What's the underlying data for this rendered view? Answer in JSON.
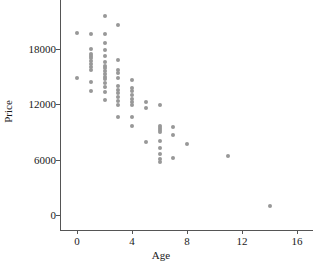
{
  "chart_data": {
    "type": "scatter",
    "title": "",
    "xlabel": "Age",
    "ylabel": "Price",
    "xlim": [
      -1.4,
      18.4
    ],
    "ylim": [
      -1600,
      21800
    ],
    "grid": false,
    "legend": null,
    "marker": {
      "shape": "circle",
      "color": "#989898",
      "size_px": 4
    },
    "xticks": [
      0,
      4,
      8,
      12,
      16
    ],
    "xtick_labels": [
      "0",
      "4",
      "8",
      "12",
      "16"
    ],
    "yticks": [
      0,
      6000,
      12000,
      18000
    ],
    "ytick_labels": [
      "0",
      "6000",
      "12000",
      "18000"
    ],
    "points": [
      {
        "x": 0,
        "y": 19700
      },
      {
        "x": 0,
        "y": 14850
      },
      {
        "x": 1,
        "y": 19600
      },
      {
        "x": 1,
        "y": 17950
      },
      {
        "x": 1,
        "y": 17500
      },
      {
        "x": 1,
        "y": 17250
      },
      {
        "x": 1,
        "y": 17000
      },
      {
        "x": 1,
        "y": 16750
      },
      {
        "x": 1,
        "y": 16400
      },
      {
        "x": 1,
        "y": 16100
      },
      {
        "x": 1,
        "y": 15750
      },
      {
        "x": 1,
        "y": 14400
      },
      {
        "x": 1,
        "y": 13500
      },
      {
        "x": 2,
        "y": 21550
      },
      {
        "x": 2,
        "y": 19600
      },
      {
        "x": 2,
        "y": 18650
      },
      {
        "x": 2,
        "y": 17900
      },
      {
        "x": 2,
        "y": 17200
      },
      {
        "x": 2,
        "y": 16600
      },
      {
        "x": 2,
        "y": 16200
      },
      {
        "x": 2,
        "y": 15900
      },
      {
        "x": 2,
        "y": 15600
      },
      {
        "x": 2,
        "y": 15300
      },
      {
        "x": 2,
        "y": 15000
      },
      {
        "x": 2,
        "y": 14700
      },
      {
        "x": 2,
        "y": 14350
      },
      {
        "x": 2,
        "y": 13900
      },
      {
        "x": 2,
        "y": 13300
      },
      {
        "x": 2,
        "y": 12450
      },
      {
        "x": 3,
        "y": 20600
      },
      {
        "x": 3,
        "y": 16800
      },
      {
        "x": 3,
        "y": 15700
      },
      {
        "x": 3,
        "y": 15350
      },
      {
        "x": 3,
        "y": 14900
      },
      {
        "x": 3,
        "y": 14000
      },
      {
        "x": 3,
        "y": 13600
      },
      {
        "x": 3,
        "y": 13200
      },
      {
        "x": 3,
        "y": 12750
      },
      {
        "x": 3,
        "y": 12350
      },
      {
        "x": 3,
        "y": 11950
      },
      {
        "x": 3,
        "y": 10600
      },
      {
        "x": 4,
        "y": 14650
      },
      {
        "x": 4,
        "y": 13800
      },
      {
        "x": 4,
        "y": 13400
      },
      {
        "x": 4,
        "y": 13000
      },
      {
        "x": 4,
        "y": 12600
      },
      {
        "x": 4,
        "y": 12250
      },
      {
        "x": 4,
        "y": 11900
      },
      {
        "x": 4,
        "y": 10650
      },
      {
        "x": 4,
        "y": 9700
      },
      {
        "x": 5,
        "y": 12300
      },
      {
        "x": 5,
        "y": 11600
      },
      {
        "x": 5,
        "y": 7950
      },
      {
        "x": 6,
        "y": 11900
      },
      {
        "x": 6,
        "y": 9700
      },
      {
        "x": 6,
        "y": 9450
      },
      {
        "x": 6,
        "y": 9200
      },
      {
        "x": 6,
        "y": 8950
      },
      {
        "x": 6,
        "y": 8000
      },
      {
        "x": 6,
        "y": 7250
      },
      {
        "x": 6,
        "y": 6600
      },
      {
        "x": 6,
        "y": 6100
      },
      {
        "x": 6,
        "y": 5700
      },
      {
        "x": 7,
        "y": 9500
      },
      {
        "x": 7,
        "y": 8700
      },
      {
        "x": 7,
        "y": 6200
      },
      {
        "x": 8,
        "y": 7650
      },
      {
        "x": 11,
        "y": 6400
      },
      {
        "x": 14,
        "y": 950
      }
    ]
  }
}
